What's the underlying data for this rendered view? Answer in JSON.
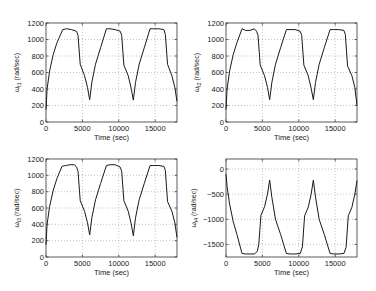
{
  "figure": {
    "width": 376,
    "height": 291,
    "line_color": "#1a1a1a",
    "axis_color": "#333333",
    "grid_color": "#9a9a9a"
  },
  "chart_data": [
    {
      "id": "omega-t1",
      "type": "line",
      "title": "",
      "xlabel": "Time (sec)",
      "ylabel_symbol": "ω",
      "ylabel_sub": "t1",
      "ylabel_unit": "(rad/sec)",
      "xlim": [
        0,
        18000
      ],
      "ylim": [
        0,
        1200
      ],
      "xticks": [
        0,
        5000,
        10000,
        15000
      ],
      "yticks": [
        0,
        200,
        400,
        600,
        800,
        1000,
        1200
      ],
      "grid": true,
      "frame": {
        "left": 46,
        "top": 23,
        "right": 177,
        "bottom": 122
      },
      "x": [
        0,
        150,
        500,
        1000,
        1500,
        2300,
        2800,
        3500,
        4200,
        4400,
        4700,
        5300,
        5700,
        6000,
        6300,
        6800,
        7500,
        8300,
        8800,
        9500,
        10200,
        10400,
        10700,
        11300,
        11700,
        12000,
        12300,
        12800,
        13500,
        14300,
        14800,
        15500,
        16200,
        16400,
        16700,
        17300,
        17700,
        18000
      ],
      "y": [
        150,
        400,
        620,
        820,
        960,
        1120,
        1130,
        1120,
        1100,
        1050,
        700,
        560,
        420,
        270,
        480,
        700,
        900,
        1130,
        1130,
        1120,
        1100,
        1050,
        690,
        560,
        410,
        265,
        480,
        700,
        900,
        1130,
        1130,
        1130,
        1120,
        1060,
        700,
        560,
        420,
        250
      ]
    },
    {
      "id": "omega-t2",
      "type": "line",
      "title": "",
      "xlabel": "Time (sec)",
      "ylabel_symbol": "ω",
      "ylabel_sub": "t2",
      "ylabel_unit": "(rad/sec)",
      "xlim": [
        0,
        18000
      ],
      "ylim": [
        0,
        1200
      ],
      "xticks": [
        0,
        5000,
        10000,
        15000
      ],
      "yticks": [
        0,
        200,
        400,
        600,
        800,
        1000,
        1200
      ],
      "grid": true,
      "frame": {
        "left": 226,
        "top": 23,
        "right": 357,
        "bottom": 122
      },
      "x": [
        0,
        150,
        500,
        1000,
        1500,
        2200,
        2700,
        3300,
        3900,
        4200,
        4400,
        4700,
        5300,
        5700,
        6000,
        6300,
        6800,
        7500,
        8300,
        8800,
        9500,
        10200,
        10400,
        10700,
        11300,
        11700,
        12000,
        12300,
        12800,
        13500,
        14300,
        14800,
        15500,
        16200,
        16400,
        16700,
        17300,
        17700,
        18000
      ],
      "y": [
        150,
        400,
        620,
        820,
        960,
        1130,
        1110,
        1110,
        1130,
        1100,
        1050,
        690,
        560,
        420,
        270,
        480,
        700,
        900,
        1120,
        1120,
        1120,
        1100,
        1050,
        690,
        560,
        410,
        270,
        480,
        700,
        900,
        1120,
        1120,
        1120,
        1110,
        1060,
        680,
        560,
        420,
        200
      ]
    },
    {
      "id": "omega-t3",
      "type": "line",
      "title": "",
      "xlabel": "Time (sec)",
      "ylabel_symbol": "ω",
      "ylabel_sub": "t3",
      "ylabel_unit": "(rad/sec)",
      "xlim": [
        0,
        18000
      ],
      "ylim": [
        0,
        1200
      ],
      "xticks": [
        0,
        5000,
        10000,
        15000
      ],
      "yticks": [
        0,
        200,
        400,
        600,
        800,
        1000,
        1200
      ],
      "grid": true,
      "frame": {
        "left": 46,
        "top": 159,
        "right": 177,
        "bottom": 257
      },
      "x": [
        0,
        150,
        500,
        1000,
        1500,
        2200,
        2700,
        3300,
        3900,
        4200,
        4400,
        4700,
        5300,
        5700,
        6000,
        6300,
        6800,
        7500,
        8300,
        8800,
        9500,
        10200,
        10400,
        10700,
        11300,
        11700,
        12000,
        12300,
        12800,
        13500,
        14300,
        14800,
        15500,
        16200,
        16400,
        16700,
        17300,
        17700,
        18000
      ],
      "y": [
        150,
        400,
        620,
        820,
        960,
        1110,
        1120,
        1130,
        1130,
        1100,
        1050,
        690,
        560,
        420,
        270,
        480,
        700,
        900,
        1120,
        1130,
        1130,
        1100,
        1050,
        690,
        560,
        410,
        260,
        480,
        700,
        900,
        1120,
        1120,
        1120,
        1110,
        1060,
        680,
        560,
        420,
        240
      ]
    },
    {
      "id": "omega-t4",
      "type": "line",
      "title": "",
      "xlabel": "Time (sec)",
      "ylabel_symbol": "ω",
      "ylabel_sub": "t4",
      "ylabel_unit": "(rad/sec)",
      "xlim": [
        0,
        18000
      ],
      "ylim": [
        -1750,
        200
      ],
      "xticks": [
        0,
        5000,
        10000,
        15000
      ],
      "yticks": [
        -1500,
        -1000,
        -500,
        0
      ],
      "grid": true,
      "frame": {
        "left": 226,
        "top": 159,
        "right": 357,
        "bottom": 257
      },
      "x": [
        0,
        150,
        500,
        1000,
        1500,
        2200,
        2700,
        3300,
        3900,
        4300,
        4500,
        4800,
        5300,
        5700,
        6000,
        6300,
        6800,
        7500,
        8300,
        8800,
        9500,
        10200,
        10500,
        10800,
        11300,
        11700,
        12000,
        12300,
        12800,
        13500,
        14300,
        14800,
        15500,
        16200,
        16500,
        16800,
        17300,
        17700,
        18000
      ],
      "y": [
        -100,
        -350,
        -700,
        -1050,
        -1300,
        -1680,
        -1690,
        -1690,
        -1690,
        -1640,
        -1500,
        -920,
        -750,
        -500,
        -220,
        -560,
        -1000,
        -1300,
        -1680,
        -1690,
        -1690,
        -1680,
        -1550,
        -930,
        -760,
        -500,
        -220,
        -560,
        -1000,
        -1300,
        -1680,
        -1690,
        -1690,
        -1680,
        -1560,
        -930,
        -760,
        -500,
        -230
      ]
    }
  ]
}
